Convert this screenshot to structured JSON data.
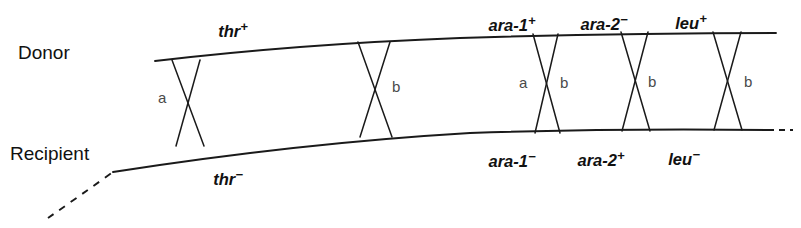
{
  "figure": {
    "stroke_color": "#1a1a1a",
    "text_color": "#111111",
    "crossover_label_color": "#4a4a4a",
    "background": "#ffffff"
  },
  "strands": {
    "donor": {
      "role_label": "Donor",
      "role_label_x": 18,
      "role_label_y": 59,
      "path": "M 155 61 Q 300 44 460 38 Q 620 33 776 33",
      "dashed": false
    },
    "recipient": {
      "role_label": "Recipient",
      "role_label_x": 10,
      "role_label_y": 160,
      "path": "M 113 172 Q 300 143 470 133 Q 620 128 768 130",
      "lead_dashes": "M 48 218 Q 78 197 113 172",
      "trail_dashes": "M 768 130 L 793 130"
    }
  },
  "gene_labels": {
    "donor_top": [
      {
        "name": "thr",
        "charge": "+",
        "x": 233,
        "y": 23
      },
      {
        "name": "ara-1",
        "charge": "+",
        "x": 512,
        "y": 17
      },
      {
        "name": "ara-2",
        "charge": "−",
        "x": 604,
        "y": 16
      },
      {
        "name": "leu",
        "charge": "+",
        "x": 691,
        "y": 15
      }
    ],
    "recipient_bottom": [
      {
        "name": "thr",
        "charge": "−",
        "x": 228,
        "y": 171
      },
      {
        "name": "ara-1",
        "charge": "−",
        "x": 512,
        "y": 153
      },
      {
        "name": "ara-2",
        "charge": "+",
        "x": 601,
        "y": 152
      },
      {
        "name": "leu",
        "charge": "−",
        "x": 684,
        "y": 151
      }
    ]
  },
  "crossovers": [
    {
      "id": "crossover-thr",
      "top_left_x": 172,
      "top_right_x": 200,
      "top_y": 60,
      "bottom_left_x": 176,
      "bottom_right_x": 204,
      "bottom_y": 146,
      "labels": [
        {
          "text": "a",
          "x": 158,
          "y": 103
        }
      ]
    },
    {
      "id": "crossover-mid",
      "top_left_x": 358,
      "top_right_x": 390,
      "top_y": 42,
      "bottom_left_x": 360,
      "bottom_right_x": 392,
      "bottom_y": 137,
      "labels": [
        {
          "text": "b",
          "x": 392,
          "y": 92
        }
      ]
    },
    {
      "id": "crossover-ara-1",
      "top_left_x": 533,
      "top_right_x": 558,
      "top_y": 34,
      "bottom_left_x": 535,
      "bottom_right_x": 560,
      "bottom_y": 133,
      "labels": [
        {
          "text": "a",
          "x": 519,
          "y": 88
        },
        {
          "text": "b",
          "x": 560,
          "y": 88
        }
      ]
    },
    {
      "id": "crossover-ara-2",
      "top_left_x": 621,
      "top_right_x": 648,
      "top_y": 32,
      "bottom_left_x": 622,
      "bottom_right_x": 650,
      "bottom_y": 131,
      "labels": [
        {
          "text": "b",
          "x": 648,
          "y": 87
        }
      ]
    },
    {
      "id": "crossover-leu",
      "top_left_x": 713,
      "top_right_x": 741,
      "top_y": 32,
      "bottom_left_x": 714,
      "bottom_right_x": 742,
      "bottom_y": 130,
      "labels": [
        {
          "text": "b",
          "x": 744,
          "y": 87
        }
      ]
    }
  ]
}
